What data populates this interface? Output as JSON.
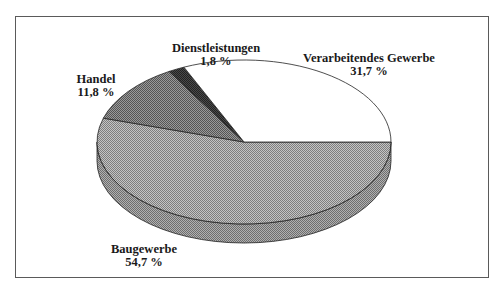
{
  "chart_data": {
    "type": "pie",
    "title": "",
    "style": "3d-pie",
    "categories": [
      "Baugewerbe",
      "Handel",
      "Dienstleistungen",
      "Verarbeitendes Gewerbe"
    ],
    "values": [
      54.7,
      11.8,
      1.8,
      31.7
    ],
    "value_labels": [
      "54,7 %",
      "11,8 %",
      "1,8 %",
      "31,7 %"
    ],
    "colors": [
      "#a6a6a6",
      "#7a7a7a",
      "#3a3a3a",
      "#ffffff"
    ],
    "legend": "none (direct labels)",
    "unit": "%"
  },
  "labels": {
    "baugewerbe": {
      "name": "Baugewerbe",
      "value": "54,7 %"
    },
    "handel": {
      "name": "Handel",
      "value": "11,8 %"
    },
    "dienstleistungen": {
      "name": "Dienstleistungen",
      "value": "1,8 %"
    },
    "verarbeitendes": {
      "name": "Verarbeitendes Gewerbe",
      "value": "31,7 %"
    }
  }
}
